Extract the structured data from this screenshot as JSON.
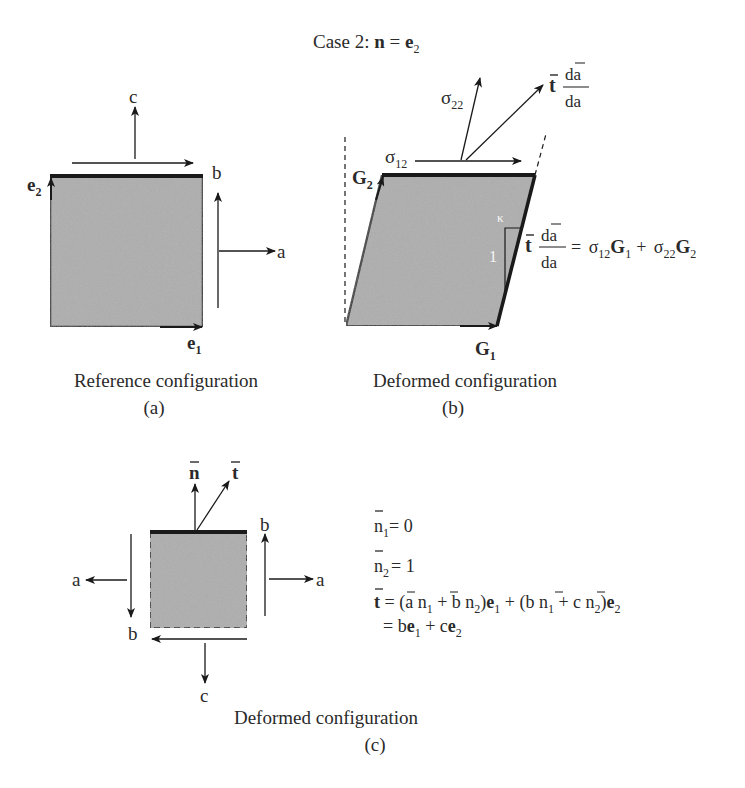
{
  "title": {
    "prefix": "Case 2: ",
    "n": "n",
    "eq": " = ",
    "e": "e",
    "sub": "2"
  },
  "panel_a": {
    "caption": "Reference configuration",
    "tag": "(a)",
    "labels": {
      "c": "c",
      "b": "b",
      "a": "a",
      "e1": "e",
      "e1_sub": "1",
      "e2": "e",
      "e2_sub": "2"
    }
  },
  "panel_b": {
    "caption": "Deformed configuration",
    "tag": "(b)",
    "labels": {
      "sigma22": "σ",
      "sigma22_sub": "22",
      "sigma12": "σ",
      "sigma12_sub": "12",
      "G1": "G",
      "G1_sub": "1",
      "G2": "G",
      "G2_sub": "2",
      "kappa": "κ",
      "one": "1",
      "t": "t",
      "da_bar": "da",
      "da": "da"
    },
    "equation": {
      "lhs_t": "t",
      "lhs_num": "da",
      "lhs_den": "da",
      "eq": "=",
      "s1": "σ",
      "s1_sub": "12",
      "G1": "G",
      "G1_sub": "1",
      "plus": "+",
      "s2": "σ",
      "s2_sub": "22",
      "G2": "G",
      "G2_sub": "2"
    }
  },
  "panel_c": {
    "caption": "Deformed configuration",
    "tag": "(c)",
    "labels": {
      "n_bar": "n",
      "t_bar": "t",
      "a_left": "a",
      "a_right": "a",
      "b_left": "b",
      "b_right": "b",
      "c": "c"
    },
    "equations": {
      "line1": {
        "var": "n",
        "sub": "1",
        "rhs": "= 0"
      },
      "line2": {
        "var": "n",
        "sub": "2",
        "rhs": "= 1"
      },
      "line3": {
        "t": "t",
        "part1": "= (a ",
        "n1": "n",
        "n1_sub": "1",
        "part2": " + b ",
        "n2": "n",
        "n2_sub": "2",
        "part3": ")",
        "e1": "e",
        "e1_sub": "1",
        "part4": " + (b ",
        "n3": "n",
        "n3_sub": "1",
        "part5": " + c ",
        "n4": "n",
        "n4_sub": "2",
        "part6": ")",
        "e2": "e",
        "e2_sub": "2"
      },
      "line4": {
        "part1": "= b",
        "e1": "e",
        "e1_sub": "1",
        "part2": " + c",
        "e2": "e",
        "e2_sub": "2"
      }
    }
  },
  "colors": {
    "fill": "#a9a9a9",
    "stroke": "#1a1a1a",
    "text": "#2a2a2a"
  }
}
